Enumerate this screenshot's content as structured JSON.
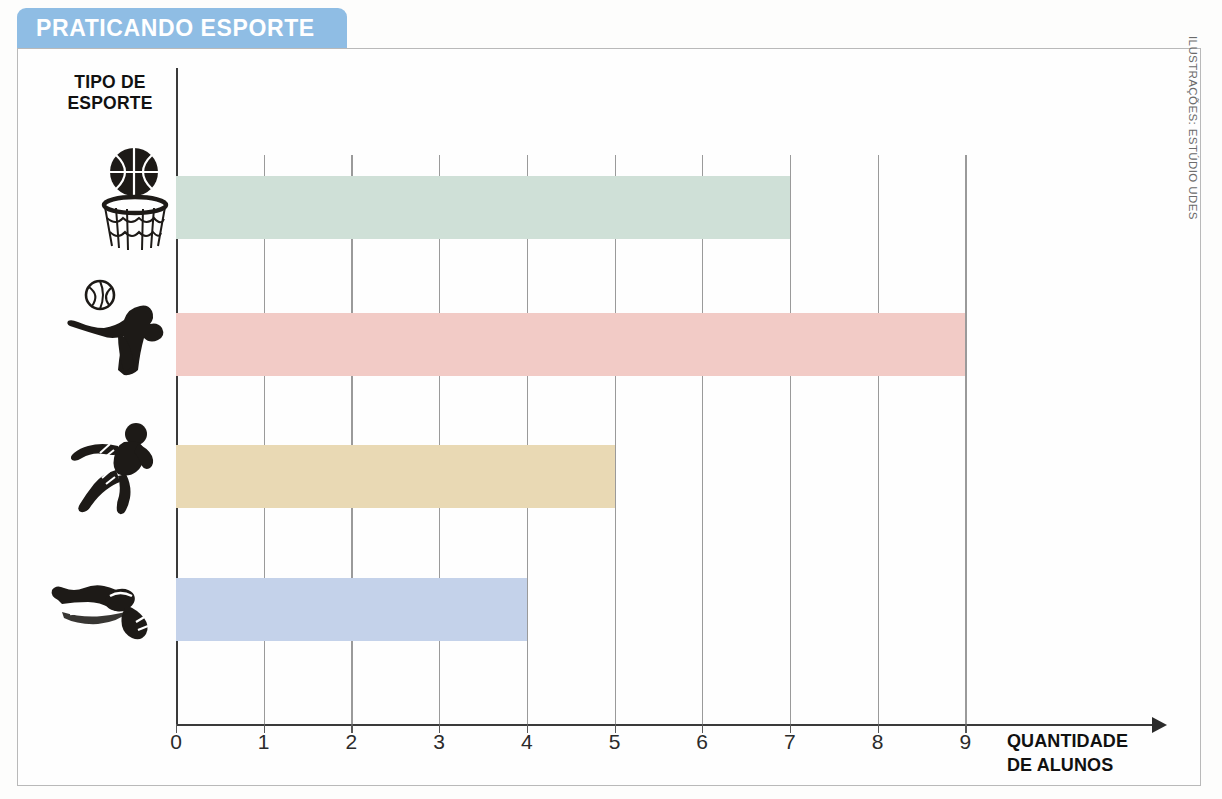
{
  "banner": {
    "title": "PRATICANDO ESPORTE",
    "color": "#8fbde4",
    "text_color": "#ffffff"
  },
  "credit": {
    "text": "ILUSTRAÇÕES: ESTÚDIO UDES"
  },
  "axes": {
    "y_title_line1": "TIPO DE",
    "y_title_line2": "ESPORTE",
    "x_title_line1": "QUANTIDADE",
    "x_title_line2": "DE ALUNOS"
  },
  "chart_data": {
    "type": "bar",
    "orientation": "horizontal",
    "title": "PRATICANDO ESPORTE",
    "xlabel": "QUANTIDADE DE ALUNOS",
    "ylabel": "TIPO DE ESPORTE",
    "categories": [
      "Basquete",
      "Vôlei",
      "Corrida",
      "Natação"
    ],
    "category_icons": [
      "basketball-hoop-icon",
      "volleyball-player-icon",
      "runner-icon",
      "swimmer-icon"
    ],
    "values": [
      7,
      9,
      5,
      4
    ],
    "colors": [
      "#cfe0d7",
      "#f2cbc6",
      "#eada b4",
      "#c4d2ea"
    ],
    "bar_colors": [
      "#cfe0d7",
      "#f2cbc6",
      "#e9d9b4",
      "#c4d2ea"
    ],
    "xlim": [
      0,
      9
    ],
    "xticks": [
      0,
      1,
      2,
      3,
      4,
      5,
      6,
      7,
      8,
      9
    ],
    "xtick_labels": [
      "0",
      "1",
      "2",
      "3",
      "4",
      "5",
      "6",
      "7",
      "8",
      "9"
    ],
    "grid": true,
    "grid_axis": "x",
    "legend": false
  }
}
